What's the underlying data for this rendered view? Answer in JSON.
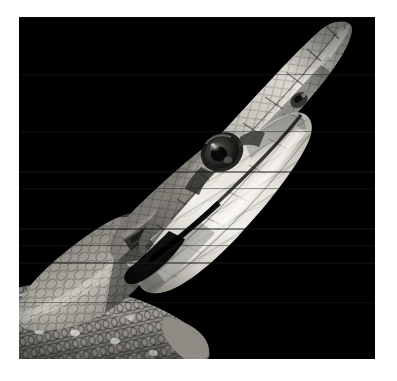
{
  "page": {
    "background_color": "#ffffff",
    "width": 397,
    "height": 381
  },
  "photo": {
    "name": "snake-head-photograph",
    "alt_text": "Close-up grayscale photograph of a snake's head and upper body raised against a solid black background",
    "subject": "snake",
    "subject_detail": "rat snake head in profile, mouth closed, pointed snout angled up to the right",
    "color_mode": "grayscale",
    "orientation": "landscape",
    "frame": {
      "x": 19,
      "y": 17,
      "width": 356,
      "height": 342
    },
    "background_color": "#000000",
    "highlight_color": "#f2f0ea",
    "midtone_color": "#9a9890",
    "shadow_color": "#262522",
    "parts": [
      {
        "label": "snout-tip",
        "x": 336,
        "y": 22
      },
      {
        "label": "nostril",
        "x": 300,
        "y": 100
      },
      {
        "label": "eye",
        "x": 203,
        "y": 135
      },
      {
        "label": "jaw-line",
        "x": 170,
        "y": 195
      },
      {
        "label": "chin-shields",
        "x": 200,
        "y": 230
      },
      {
        "label": "neck",
        "x": 90,
        "y": 250
      },
      {
        "label": "coiled-body",
        "x": 100,
        "y": 320
      }
    ],
    "caption": ""
  }
}
